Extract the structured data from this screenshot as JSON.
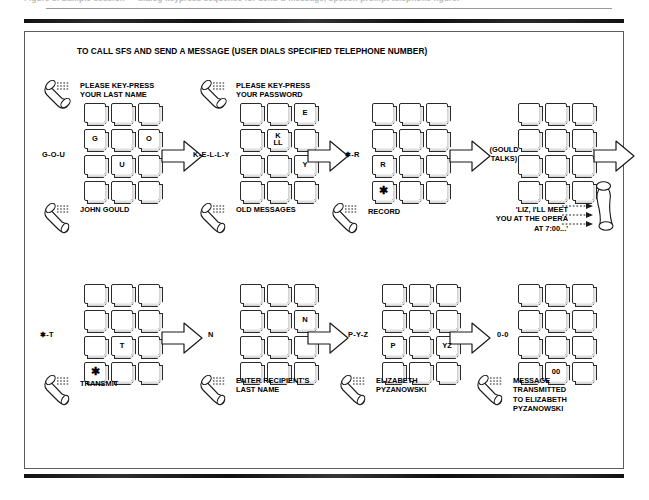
{
  "page": {
    "cut_caption": "Figure 5.  Sample session — dialog keypress sequence for send-a-message, speech-prompt telephone figure.",
    "figure_title": "TO CALL SFS AND SEND A MESSAGE (USER DIALS SPECIFIED TELEPHONE NUMBER)"
  },
  "colors": {
    "ink": "#000000",
    "key_outline": "#2b2b2b",
    "box_border": "#5c5c5c",
    "rule": "#121212",
    "paper": "#ffffff"
  },
  "icons": {
    "handset": "telephone-handset-icon",
    "sound": "sound-wave-icon",
    "arrow": "block-arrow-right-icon"
  },
  "steps": [
    {
      "id": "step-1",
      "code": "G-O-U",
      "prompt": "PLEASE KEY-PRESS\nYOUR LAST NAME",
      "result": "JOHN GOULD",
      "keys": [
        {
          "row": 2,
          "col": 1,
          "label": "G"
        },
        {
          "row": 2,
          "col": 3,
          "label": "O"
        },
        {
          "row": 3,
          "col": 2,
          "label": "U"
        }
      ]
    },
    {
      "id": "step-2",
      "code": "K-E-L-L-Y",
      "prompt": "PLEASE KEY-PRESS\nYOUR PASSWORD",
      "result": "OLD MESSAGES",
      "keys": [
        {
          "row": 1,
          "col": 3,
          "label": "E"
        },
        {
          "row": 2,
          "col": 2,
          "label": "K",
          "label2": "LL"
        },
        {
          "row": 3,
          "col": 3,
          "label": "Y"
        }
      ]
    },
    {
      "id": "step-3",
      "code": "✱-R",
      "prompt": "",
      "result": "RECORD",
      "keys": [
        {
          "row": 3,
          "col": 1,
          "label": "R"
        },
        {
          "row": 4,
          "col": 1,
          "label": "✱",
          "star": true
        }
      ]
    },
    {
      "id": "step-4",
      "code": "(GOULD\nTALKS)",
      "prompt": "",
      "message": "'LIZ, I'LL MEET\nYOU AT THE OPERA\nAT 7:00...'",
      "keys": []
    },
    {
      "id": "step-5",
      "code": "✱-T",
      "prompt": "",
      "result": "TRANSMIT",
      "keys": [
        {
          "row": 3,
          "col": 2,
          "label": "T"
        },
        {
          "row": 4,
          "col": 1,
          "label": "✱",
          "star": true
        }
      ]
    },
    {
      "id": "step-6",
      "code": "N",
      "prompt": "",
      "result": "ENTER RECIPIENT'S\nLAST NAME",
      "keys": [
        {
          "row": 2,
          "col": 3,
          "label": "N"
        }
      ]
    },
    {
      "id": "step-7",
      "code": "P-Y-Z",
      "prompt": "",
      "result": "ELIZABETH\nPYZANOWSKI",
      "keys": [
        {
          "row": 3,
          "col": 1,
          "label": "P"
        },
        {
          "row": 3,
          "col": 3,
          "label": "YZ"
        }
      ]
    },
    {
      "id": "step-8",
      "code": "0-0",
      "prompt": "",
      "result": "MESSAGE\nTRANSMITTED\nTO ELIZABETH\nPYZANOWSKI",
      "keys": [
        {
          "row": 4,
          "col": 2,
          "label": "00"
        }
      ]
    }
  ]
}
